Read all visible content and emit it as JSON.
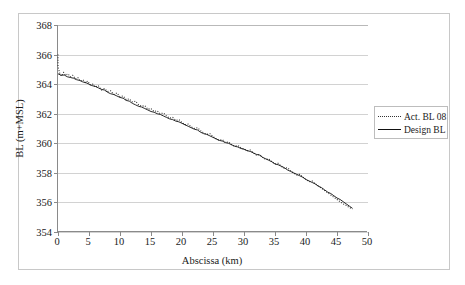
{
  "chart_data": {
    "type": "line",
    "title": "",
    "xlabel": "Abscissa (km)",
    "ylabel": "BL (m+MSL)",
    "xlim": [
      0,
      50
    ],
    "ylim": [
      354,
      368
    ],
    "xticks": [
      0,
      5,
      10,
      15,
      20,
      25,
      30,
      35,
      40,
      45,
      50
    ],
    "yticks": [
      354,
      356,
      358,
      360,
      362,
      364,
      366,
      368
    ],
    "grid": "horizontal",
    "legend_position": "right",
    "series": [
      {
        "name": "Act. BL 08",
        "style": "dotted",
        "color": "#333333",
        "x": [
          0.0,
          0.0,
          0.3,
          0.6,
          0.9,
          1.2,
          1.6,
          2.0,
          2.4,
          2.8,
          3.2,
          3.6,
          4.0,
          4.4,
          4.8,
          5.2,
          5.6,
          6.0,
          6.5,
          7.0,
          7.5,
          8.0,
          8.5,
          9.0,
          9.5,
          10.0,
          10.5,
          11.0,
          11.5,
          12.0,
          12.5,
          13.0,
          13.5,
          14.0,
          14.5,
          15.0,
          15.5,
          16.0,
          16.5,
          17.0,
          17.5,
          18.0,
          18.5,
          19.0,
          19.5,
          20.0,
          20.5,
          21.0,
          21.5,
          22.0,
          22.5,
          23.0,
          23.5,
          24.0,
          24.5,
          25.0,
          25.5,
          26.0,
          26.5,
          27.0,
          27.5,
          28.0,
          28.5,
          29.0,
          29.5,
          30.0,
          30.5,
          31.0,
          31.5,
          32.0,
          32.5,
          33.0,
          33.5,
          34.0,
          34.5,
          35.0,
          35.5,
          36.0,
          36.5,
          37.0,
          37.5,
          38.0,
          38.5,
          39.0,
          39.5,
          40.0,
          40.5,
          41.0,
          41.5,
          42.0,
          42.5,
          43.0,
          43.5,
          44.0,
          44.5,
          45.0,
          45.5,
          46.0,
          46.5,
          47.0,
          47.5
        ],
        "y": [
          366.0,
          365.2,
          364.7,
          364.55,
          364.8,
          364.6,
          364.7,
          364.5,
          364.6,
          364.35,
          364.45,
          364.2,
          364.3,
          364.1,
          364.2,
          363.95,
          364.0,
          363.8,
          363.9,
          363.6,
          363.7,
          363.5,
          363.55,
          363.3,
          363.4,
          363.15,
          363.2,
          362.95,
          363.0,
          362.8,
          362.85,
          362.6,
          362.5,
          362.55,
          362.3,
          362.35,
          362.15,
          362.2,
          362.0,
          362.05,
          361.85,
          361.7,
          361.75,
          361.55,
          361.6,
          361.4,
          361.25,
          361.3,
          361.1,
          361.0,
          361.05,
          360.85,
          360.7,
          360.6,
          360.65,
          360.45,
          360.3,
          360.2,
          360.25,
          360.05,
          360.1,
          359.9,
          359.8,
          359.85,
          359.7,
          359.6,
          359.5,
          359.55,
          359.35,
          359.2,
          359.25,
          359.05,
          358.9,
          358.95,
          358.75,
          358.6,
          358.65,
          358.45,
          358.3,
          358.35,
          358.15,
          358.0,
          357.85,
          357.9,
          357.7,
          357.55,
          357.4,
          357.45,
          357.25,
          357.1,
          356.95,
          356.8,
          356.65,
          356.5,
          356.35,
          356.2,
          356.05,
          355.9,
          355.8,
          355.65,
          355.55
        ]
      },
      {
        "name": "Design BL",
        "style": "solid",
        "color": "#111111",
        "x": [
          0.0,
          0.5,
          1.0,
          1.5,
          2.0,
          2.5,
          3.0,
          3.5,
          4.0,
          4.5,
          5.0,
          5.5,
          6.0,
          6.5,
          7.0,
          7.5,
          8.0,
          8.5,
          9.0,
          9.5,
          10.0,
          10.5,
          11.0,
          11.5,
          12.0,
          12.5,
          13.0,
          13.5,
          14.0,
          14.5,
          15.0,
          15.5,
          16.0,
          16.5,
          17.0,
          17.5,
          18.0,
          18.5,
          19.0,
          19.5,
          20.0,
          20.5,
          21.0,
          21.5,
          22.0,
          22.5,
          23.0,
          23.5,
          24.0,
          24.5,
          25.0,
          25.5,
          26.0,
          26.5,
          27.0,
          27.5,
          28.0,
          28.5,
          29.0,
          29.5,
          30.0,
          30.5,
          31.0,
          31.5,
          32.0,
          32.5,
          33.0,
          33.5,
          34.0,
          34.5,
          35.0,
          35.5,
          36.0,
          36.5,
          37.0,
          37.5,
          38.0,
          38.5,
          39.0,
          39.5,
          40.0,
          40.5,
          41.0,
          41.5,
          42.0,
          42.5,
          43.0,
          43.5,
          44.0,
          44.5,
          45.0,
          45.5,
          46.0,
          46.5,
          47.0,
          47.5
        ],
        "y": [
          364.7,
          364.6,
          364.62,
          364.5,
          364.45,
          364.4,
          364.3,
          364.25,
          364.15,
          364.1,
          364.0,
          363.9,
          363.85,
          363.75,
          363.65,
          363.6,
          363.45,
          363.35,
          363.3,
          363.2,
          363.1,
          363.05,
          362.9,
          362.85,
          362.7,
          362.6,
          362.5,
          362.45,
          362.35,
          362.25,
          362.15,
          362.1,
          362.0,
          361.95,
          361.85,
          361.75,
          361.65,
          361.6,
          361.5,
          361.45,
          361.35,
          361.25,
          361.15,
          361.05,
          360.95,
          360.9,
          360.75,
          360.65,
          360.6,
          360.5,
          360.4,
          360.3,
          360.2,
          360.15,
          360.05,
          360.0,
          359.9,
          359.8,
          359.75,
          359.65,
          359.6,
          359.5,
          359.45,
          359.35,
          359.25,
          359.2,
          359.05,
          358.95,
          358.85,
          358.75,
          358.6,
          358.55,
          358.45,
          358.35,
          358.2,
          358.1,
          358.0,
          357.9,
          357.8,
          357.7,
          357.55,
          357.45,
          357.35,
          357.25,
          357.1,
          357.0,
          356.85,
          356.7,
          356.6,
          356.45,
          356.3,
          356.2,
          356.05,
          355.9,
          355.75,
          355.6
        ]
      }
    ]
  },
  "legend": {
    "entries": [
      {
        "label": "Act. BL 08"
      },
      {
        "label": "Design BL"
      }
    ]
  },
  "axes": {
    "y_title": "BL (m+MSL)",
    "x_title": "Abscissa (km)",
    "y_tick_labels": [
      "368",
      "366",
      "364",
      "362",
      "360",
      "358",
      "356",
      "354"
    ],
    "x_tick_labels": [
      "0",
      "5",
      "10",
      "15",
      "20",
      "25",
      "30",
      "35",
      "40",
      "45",
      "50"
    ]
  },
  "colors": {
    "actual_series": "#333333",
    "design_series": "#111111",
    "gridline": "#d2d2d2",
    "axis": "#8a8a8a",
    "border": "#c8c8c8"
  }
}
